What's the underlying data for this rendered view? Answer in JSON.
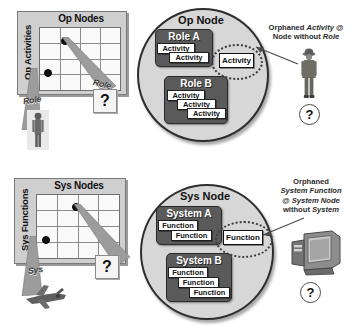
{
  "diagram": {
    "colors": {
      "circle_fill": "#d7d7d7",
      "circle_stroke": "#2e2e2e",
      "group_fill": "#5a5a5a",
      "leaf_fill": "#ffffff",
      "beam_fill": "#9c9c9c",
      "panel_fill": "#cfcfcf",
      "text": "#111111"
    }
  },
  "operational": {
    "matrix": {
      "row_axis_label": "Op Activities",
      "col_axis_label": "Op Nodes",
      "grid_cols": 4,
      "grid_rows": 4,
      "beams": [
        {
          "label": "Role",
          "target": "soldier-figure"
        },
        {
          "label": "Role",
          "target": "question-box"
        }
      ],
      "question_mark": "?"
    },
    "node": {
      "title": "Op Node",
      "groups": [
        {
          "label": "Role A",
          "items": [
            "Activity",
            "Activity"
          ]
        },
        {
          "label": "Role B",
          "items": [
            "Activity",
            "Activity",
            "Activity"
          ]
        }
      ],
      "orphan": {
        "label": "Activity"
      }
    },
    "annotation": {
      "line1": "Orphaned ",
      "line1_em": "Activity",
      "line1_tail": " @",
      "line2": "Node without ",
      "line2_em": "Role",
      "icon": "soldier-icon",
      "question_mark": "?"
    }
  },
  "systems": {
    "matrix": {
      "row_axis_label": "Sys Functions",
      "col_axis_label": "Sys Nodes",
      "grid_cols": 4,
      "grid_rows": 4,
      "beams": [
        {
          "label": "Sys",
          "target": "aircraft-figure"
        },
        {
          "label": "",
          "target": "question-box"
        }
      ],
      "question_mark": "?"
    },
    "node": {
      "title": "Sys Node",
      "groups": [
        {
          "label": "System A",
          "items": [
            "Function",
            "Function"
          ]
        },
        {
          "label": "System B",
          "items": [
            "Function",
            "Function",
            "Function"
          ]
        }
      ],
      "orphan": {
        "label": "Function"
      }
    },
    "annotation": {
      "line1": "Orphaned",
      "line2_em": "System Function",
      "line3": "@ ",
      "line3_em": "System Node",
      "line4": "without ",
      "line4_em": "System",
      "icon": "workstation-icon",
      "question_mark": "?"
    }
  }
}
